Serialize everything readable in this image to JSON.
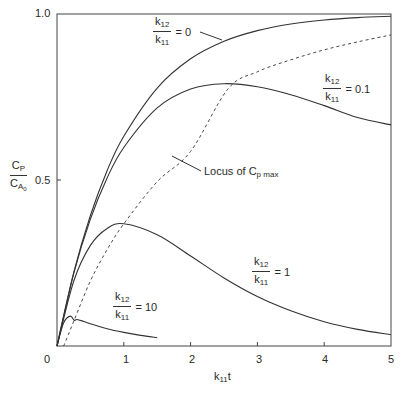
{
  "chart_data": {
    "type": "line",
    "title": "",
    "xlabel": "k11t",
    "ylabel": "CP / CA0",
    "xlim": [
      0,
      5
    ],
    "ylim": [
      0,
      1.0
    ],
    "grid": false,
    "x_ticks": [
      "0",
      "1",
      "2",
      "3",
      "4",
      "5"
    ],
    "y_ticks": [
      "0.5",
      "1.0"
    ],
    "series": [
      {
        "name": "k12/k11 = 0",
        "style": "solid",
        "x": [
          0,
          0.25,
          0.5,
          0.75,
          1,
          1.5,
          2,
          2.5,
          3,
          3.5,
          4,
          4.5,
          5
        ],
        "values": [
          0,
          0.221,
          0.393,
          0.528,
          0.632,
          0.777,
          0.865,
          0.918,
          0.95,
          0.97,
          0.982,
          0.989,
          0.993
        ]
      },
      {
        "name": "k12/k11 = 0.1",
        "style": "solid",
        "x": [
          0,
          0.25,
          0.5,
          0.75,
          1,
          1.5,
          2,
          2.5,
          3,
          3.5,
          4,
          4.5,
          5
        ],
        "values": [
          0,
          0.218,
          0.382,
          0.506,
          0.598,
          0.717,
          0.774,
          0.79,
          0.781,
          0.757,
          0.724,
          0.688,
          0.666
        ]
      },
      {
        "name": "k12/k11 = 1",
        "style": "solid",
        "x": [
          0,
          0.25,
          0.5,
          0.75,
          1,
          1.5,
          2,
          2.5,
          3,
          3.5,
          4,
          4.5,
          5
        ],
        "values": [
          0,
          0.195,
          0.303,
          0.354,
          0.368,
          0.335,
          0.271,
          0.205,
          0.149,
          0.106,
          0.073,
          0.05,
          0.034
        ]
      },
      {
        "name": "k12/k11 = 10",
        "style": "solid",
        "x": [
          0,
          0.1,
          0.2,
          0.256,
          0.3,
          0.4,
          0.5,
          0.75,
          1,
          1.25,
          1.5
        ],
        "values": [
          0,
          0.07,
          0.09,
          0.0774,
          0.08,
          0.074,
          0.067,
          0.052,
          0.041,
          0.032,
          0.025
        ]
      },
      {
        "name": "Locus of Cp max",
        "style": "dashed",
        "x": [
          0.1,
          0.256,
          0.5,
          0.75,
          1.0,
          1.5,
          2.0,
          2.558,
          3.0,
          3.5,
          4.0,
          4.5,
          5.0
        ],
        "values": [
          0.0,
          0.077,
          0.196,
          0.29,
          0.368,
          0.495,
          0.586,
          0.774,
          0.826,
          0.862,
          0.892,
          0.916,
          0.937
        ]
      }
    ],
    "annotations": [
      {
        "text": "k12/k11 = 0",
        "x": 1.9,
        "y": 0.95
      },
      {
        "text": "k12/k11 = 0.1",
        "x": 4.1,
        "y": 0.8
      },
      {
        "text": "Locus of Cp max",
        "x": 2.4,
        "y": 0.52
      },
      {
        "text": "k12/k11 = 1",
        "x": 3.0,
        "y": 0.22
      },
      {
        "text": "k12/k11 = 10",
        "x": 0.4,
        "y": 0.16
      }
    ]
  },
  "labels": {
    "y_axis_num": "C",
    "y_axis_num_sub": "P",
    "y_axis_den": "C",
    "y_axis_den_sub": "A",
    "y_axis_den_subsub": "0",
    "x_axis": "k",
    "x_axis_sub": "11",
    "x_axis_tail": "t",
    "tick_0": "0",
    "tick_1": "1",
    "tick_2": "2",
    "tick_3": "3",
    "tick_4": "4",
    "tick_5": "5",
    "ytick_05": "0.5",
    "ytick_10": "1.0",
    "ratio_num": "k",
    "ratio_num_sub": "12",
    "ratio_den": "k",
    "ratio_den_sub": "11",
    "eq_0": "= 0",
    "eq_01": "= 0.1",
    "eq_1": "= 1",
    "eq_10": "= 10",
    "locus_text": "Locus of C",
    "locus_sub": "p max"
  }
}
